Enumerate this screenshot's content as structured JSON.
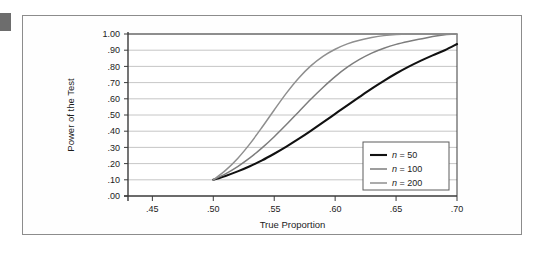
{
  "figure": {
    "corner_marker": "dark-square-tab"
  },
  "chart_data": {
    "type": "line",
    "title": "",
    "xlabel": "True Proportion",
    "ylabel": "Power of the Test",
    "xlim": [
      0.43,
      0.7
    ],
    "ylim": [
      0.0,
      1.0
    ],
    "grid": true,
    "legend_position": "inside-bottom-right",
    "xticks": [
      0.45,
      0.5,
      0.55,
      0.6,
      0.65,
      0.7
    ],
    "xtick_labels": [
      ".45",
      ".50",
      ".55",
      ".60",
      ".65",
      ".70"
    ],
    "yticks": [
      0.0,
      0.1,
      0.2,
      0.3,
      0.4,
      0.5,
      0.6,
      0.7,
      0.8,
      0.9,
      1.0
    ],
    "ytick_labels": [
      ".00",
      ".10",
      ".20",
      ".30",
      ".40",
      ".50",
      ".60",
      ".70",
      ".80",
      ".90",
      "1.00"
    ],
    "x": [
      0.5,
      0.51,
      0.52,
      0.53,
      0.54,
      0.55,
      0.56,
      0.57,
      0.58,
      0.59,
      0.6,
      0.61,
      0.62,
      0.63,
      0.64,
      0.65,
      0.66,
      0.67,
      0.68,
      0.69,
      0.7
    ],
    "series": [
      {
        "name": "n = 50",
        "n": 50,
        "color": "#111111",
        "width": 2.1,
        "values": [
          0.1,
          0.124,
          0.152,
          0.184,
          0.22,
          0.261,
          0.305,
          0.352,
          0.402,
          0.454,
          0.507,
          0.56,
          0.612,
          0.663,
          0.711,
          0.756,
          0.797,
          0.834,
          0.868,
          0.9,
          0.938
        ]
      },
      {
        "name": "n = 100",
        "n": 100,
        "color": "#7d7d7d",
        "width": 1.5,
        "values": [
          0.1,
          0.137,
          0.182,
          0.235,
          0.297,
          0.366,
          0.441,
          0.519,
          0.597,
          0.67,
          0.737,
          0.795,
          0.843,
          0.882,
          0.912,
          0.936,
          0.954,
          0.969,
          0.984,
          0.995,
          1.0
        ]
      },
      {
        "name": "n = 200",
        "n": 200,
        "color": "#8f8f8f",
        "width": 1.5,
        "values": [
          0.1,
          0.158,
          0.232,
          0.322,
          0.424,
          0.531,
          0.635,
          0.727,
          0.803,
          0.862,
          0.906,
          0.939,
          0.962,
          0.978,
          0.99,
          0.997,
          1.0,
          1.0,
          1.0,
          1.0,
          1.0
        ]
      }
    ],
    "legend_entries": [
      {
        "prefix": "n",
        "equals": " = ",
        "value": "50",
        "color": "#111111",
        "width": 2.1
      },
      {
        "prefix": "n",
        "equals": " = ",
        "value": "100",
        "color": "#7d7d7d",
        "width": 1.5
      },
      {
        "prefix": "n",
        "equals": " = ",
        "value": "200",
        "color": "#8f8f8f",
        "width": 1.5
      }
    ],
    "colors": {
      "axis": "#3a3a3a",
      "grid": "#b8b8b8",
      "frame": "#8c8c8c",
      "text": "#1c1c1c",
      "plot_background": "#ffffff"
    }
  }
}
